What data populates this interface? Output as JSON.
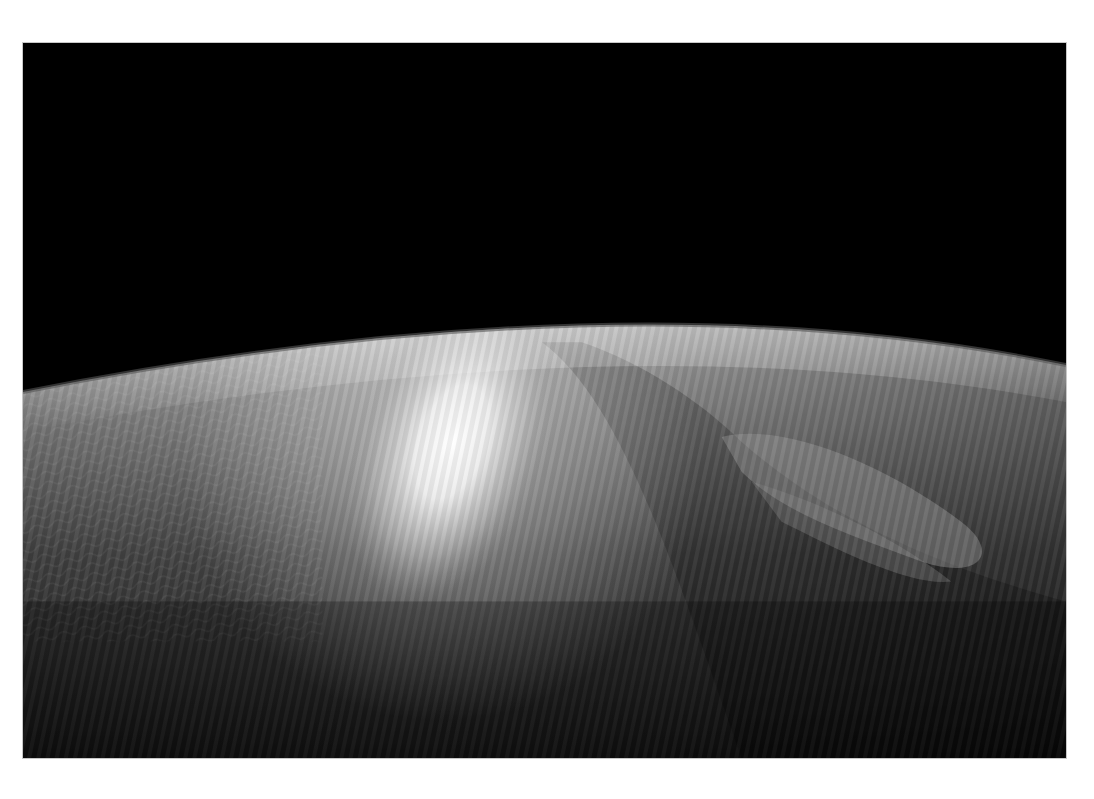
{
  "page": {
    "background": "#ffffff"
  },
  "photo": {
    "subject": "Earth horizon from orbit with sun glint on clouds",
    "colors": {
      "space": "#000000",
      "glint": "#ffffff",
      "upper_clouds": "#b4b4b4",
      "mid_surface": "#6e6e6e",
      "lower_surface": "#1e1e1e",
      "frame_border": "#c8c8c8"
    },
    "horizon": {
      "left_y": 350,
      "peak_x": 600,
      "peak_y": 276,
      "right_y": 323
    },
    "glint": {
      "cx": 430,
      "cy": 400,
      "rx": 95,
      "ry": 170
    }
  }
}
